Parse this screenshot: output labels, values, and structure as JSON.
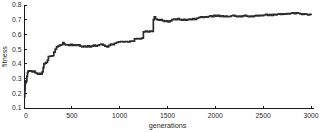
{
  "style": {
    "background": "#fefefe",
    "line_color": "#2b2b2b",
    "axis_color": "#1a1a1a",
    "text_color": "#2a2a2a"
  },
  "chart_data": {
    "type": "line",
    "title": "",
    "xlabel": "generations",
    "ylabel": "fitness",
    "xlim": [
      0,
      3000
    ],
    "ylim": [
      0.1,
      0.8
    ],
    "x_ticks": [
      0,
      500,
      1000,
      1500,
      2000,
      2500,
      3000
    ],
    "x_tick_labels": [
      "0",
      "500",
      "1000",
      "1500",
      "2000",
      "2500",
      "3000"
    ],
    "y_ticks": [
      0.1,
      0.2,
      0.3,
      0.4,
      0.5,
      0.6,
      0.7,
      0.8
    ],
    "y_tick_labels": [
      "0.1",
      "0.2",
      "0.3",
      "0.4",
      "0.5",
      "0.6",
      "0.7",
      "0.8"
    ],
    "grid": false,
    "legend": null,
    "series": [
      {
        "name": "fitness",
        "step": true,
        "x": [
          0,
          8,
          12,
          18,
          22,
          26,
          30,
          36,
          42,
          55,
          70,
          85,
          100,
          115,
          130,
          145,
          160,
          175,
          190,
          200,
          208,
          220,
          232,
          245,
          255,
          275,
          295,
          312,
          326,
          340,
          355,
          372,
          390,
          405,
          418,
          432,
          450,
          468,
          486,
          505,
          525,
          545,
          565,
          585,
          605,
          625,
          645,
          665,
          685,
          705,
          725,
          745,
          765,
          785,
          805,
          825,
          845,
          865,
          885,
          905,
          925,
          945,
          965,
          985,
          1010,
          1035,
          1060,
          1085,
          1110,
          1135,
          1155,
          1180,
          1205,
          1228,
          1248,
          1270,
          1292,
          1315,
          1338,
          1352,
          1362,
          1375,
          1390,
          1405,
          1425,
          1445,
          1465,
          1485,
          1505,
          1525,
          1545,
          1565,
          1585,
          1605,
          1625,
          1645,
          1665,
          1685,
          1705,
          1725,
          1745,
          1765,
          1785,
          1805,
          1825,
          1845,
          1865,
          1885,
          1905,
          1925,
          1945,
          1965,
          1985,
          2005,
          2025,
          2045,
          2065,
          2085,
          2105,
          2125,
          2145,
          2165,
          2185,
          2205,
          2225,
          2245,
          2265,
          2285,
          2305,
          2325,
          2345,
          2365,
          2385,
          2405,
          2425,
          2445,
          2465,
          2485,
          2505,
          2525,
          2545,
          2565,
          2585,
          2605,
          2625,
          2645,
          2665,
          2685,
          2705,
          2725,
          2745,
          2765,
          2785,
          2805,
          2825,
          2845,
          2865,
          2885,
          2905,
          2925,
          2945,
          2965,
          2985,
          3000
        ],
        "y": [
          0.175,
          0.22,
          0.265,
          0.285,
          0.275,
          0.285,
          0.315,
          0.34,
          0.35,
          0.353,
          0.35,
          0.345,
          0.35,
          0.34,
          0.335,
          0.33,
          0.335,
          0.33,
          0.345,
          0.375,
          0.4,
          0.405,
          0.41,
          0.425,
          0.45,
          0.452,
          0.455,
          0.48,
          0.5,
          0.515,
          0.52,
          0.527,
          0.53,
          0.545,
          0.535,
          0.528,
          0.53,
          0.525,
          0.532,
          0.525,
          0.53,
          0.525,
          0.53,
          0.52,
          0.515,
          0.52,
          0.515,
          0.522,
          0.515,
          0.52,
          0.527,
          0.52,
          0.525,
          0.53,
          0.535,
          0.527,
          0.52,
          0.515,
          0.525,
          0.535,
          0.53,
          0.54,
          0.545,
          0.55,
          0.552,
          0.55,
          0.552,
          0.55,
          0.555,
          0.555,
          0.57,
          0.572,
          0.57,
          0.575,
          0.618,
          0.622,
          0.618,
          0.622,
          0.62,
          0.7,
          0.72,
          0.705,
          0.7,
          0.697,
          0.7,
          0.694,
          0.688,
          0.692,
          0.685,
          0.692,
          0.7,
          0.705,
          0.7,
          0.707,
          0.7,
          0.697,
          0.702,
          0.697,
          0.7,
          0.705,
          0.7,
          0.707,
          0.702,
          0.71,
          0.715,
          0.72,
          0.715,
          0.72,
          0.717,
          0.722,
          0.727,
          0.72,
          0.73,
          0.725,
          0.73,
          0.722,
          0.727,
          0.72,
          0.725,
          0.72,
          0.722,
          0.727,
          0.73,
          0.725,
          0.72,
          0.725,
          0.72,
          0.726,
          0.73,
          0.725,
          0.72,
          0.724,
          0.72,
          0.726,
          0.73,
          0.726,
          0.73,
          0.727,
          0.732,
          0.736,
          0.73,
          0.735,
          0.73,
          0.736,
          0.732,
          0.737,
          0.74,
          0.736,
          0.74,
          0.737,
          0.742,
          0.74,
          0.744,
          0.746,
          0.742,
          0.746,
          0.744,
          0.74,
          0.736,
          0.74,
          0.737,
          0.733,
          0.736,
          0.73
        ]
      }
    ]
  }
}
